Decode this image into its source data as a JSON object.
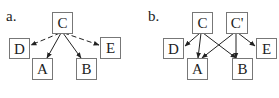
{
  "panels": [
    {
      "label": "a.",
      "nodes": {
        "C": {
          "text": "C",
          "x": 52,
          "y": 12,
          "w": 21,
          "h": 21
        },
        "D": {
          "text": "D",
          "x": 9,
          "y": 38,
          "w": 21,
          "h": 21
        },
        "E": {
          "text": "E",
          "x": 100,
          "y": 38,
          "w": 21,
          "h": 21
        },
        "A": {
          "text": "A",
          "x": 32,
          "y": 59,
          "w": 21,
          "h": 21
        },
        "B": {
          "text": "B",
          "x": 76,
          "y": 59,
          "w": 21,
          "h": 21
        }
      },
      "edges": [
        {
          "from": "C",
          "to": "D",
          "style": "dashed"
        },
        {
          "from": "C",
          "to": "E",
          "style": "dashed"
        },
        {
          "from": "C",
          "to": "A",
          "style": "solid"
        },
        {
          "from": "C",
          "to": "B",
          "style": "solid"
        }
      ]
    },
    {
      "label": "b.",
      "nodes": {
        "C": {
          "text": "C",
          "x": 192,
          "y": 12,
          "w": 21,
          "h": 21
        },
        "Cp": {
          "text": "C'",
          "x": 226,
          "y": 12,
          "w": 21,
          "h": 21
        },
        "D": {
          "text": "D",
          "x": 163,
          "y": 38,
          "w": 21,
          "h": 21
        },
        "E": {
          "text": "E",
          "x": 256,
          "y": 38,
          "w": 21,
          "h": 21
        },
        "A": {
          "text": "A",
          "x": 187,
          "y": 59,
          "w": 21,
          "h": 21
        },
        "B": {
          "text": "B",
          "x": 232,
          "y": 59,
          "w": 21,
          "h": 21
        }
      },
      "edges": [
        {
          "from": "C",
          "to": "D",
          "style": "solid"
        },
        {
          "from": "C",
          "to": "A",
          "style": "solid"
        },
        {
          "from": "C",
          "to": "B",
          "style": "solid"
        },
        {
          "from": "Cp",
          "to": "A",
          "style": "solid"
        },
        {
          "from": "Cp",
          "to": "B",
          "style": "solid"
        },
        {
          "from": "Cp",
          "to": "E",
          "style": "solid"
        }
      ]
    }
  ]
}
